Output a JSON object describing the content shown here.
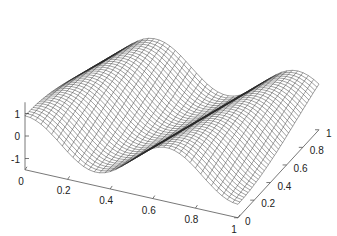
{
  "chart_data": {
    "type": "surface-mesh",
    "title": "",
    "xlabel": "",
    "ylabel": "",
    "zlabel": "",
    "x_ticks": [
      "0",
      "0.2",
      "0.4",
      "0.6",
      "0.8",
      "1"
    ],
    "y_ticks": [
      "0",
      "0.2",
      "0.4",
      "0.6",
      "0.8",
      "1"
    ],
    "z_ticks": [
      "-1",
      "0",
      "1"
    ],
    "xlim": [
      0,
      1
    ],
    "ylim": [
      0,
      1
    ],
    "zlim": [
      -1.5,
      1.5
    ],
    "grid": false,
    "mesh_resolution": [
      41,
      41
    ],
    "surface_description": "Wireframe mesh of a wave surface z varying sinusoidally along x (about 1.5 periods), with ridges sheared along y; high at x=0, valley near x≈0.35, ridge near x≈0.65, dips toward x=1",
    "colors": {
      "mesh": "#2a2a2a",
      "axes": "#555555",
      "background": "#ffffff"
    }
  }
}
